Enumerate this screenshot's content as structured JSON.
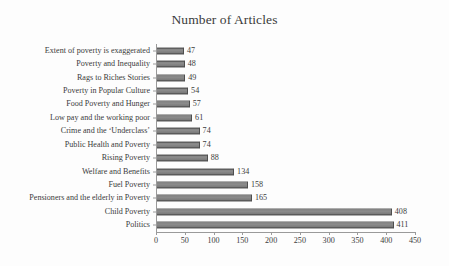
{
  "chart_data": {
    "type": "bar",
    "orientation": "horizontal",
    "title": "Number of Articles",
    "xlabel": "",
    "ylabel": "",
    "xlim": [
      0,
      450
    ],
    "xticks": [
      0,
      50,
      100,
      150,
      200,
      250,
      300,
      350,
      400,
      450
    ],
    "grid": false,
    "legend": false,
    "bar_color": "#7d7d7d",
    "text_color": "#3b3b3b",
    "axis_color": "#9a9a9a",
    "background": "#fdfdfd",
    "data_labels_shown": true,
    "categories": [
      "Extent of poverty is exaggerated",
      "Poverty and Inequality",
      "Rags to Riches Stories",
      "Poverty in Popular Culture",
      "Food Poverty and Hunger",
      "Low pay and the working poor",
      "Crime and the ‘Underclass’",
      "Public Health and Poverty",
      "Rising Poverty",
      "Welfare and Benefits",
      "Fuel Poverty",
      "Pensioners and the elderly in Poverty",
      "Child Poverty",
      "Politics"
    ],
    "values": [
      47,
      48,
      49,
      54,
      57,
      61,
      74,
      74,
      88,
      134,
      158,
      165,
      408,
      411
    ],
    "value_labels": [
      "47",
      "48",
      "49",
      "54",
      "57",
      "61",
      "74",
      "74",
      "88",
      "134",
      "158",
      "165",
      "408",
      "411"
    ],
    "xtick_labels": [
      "0",
      "50",
      "100",
      "150",
      "200",
      "250",
      "300",
      "350",
      "400",
      "450"
    ]
  }
}
